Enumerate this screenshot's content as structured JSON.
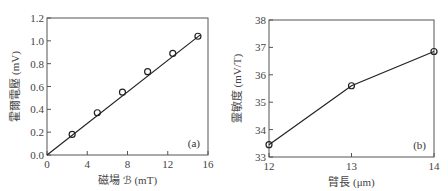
{
  "chart_data": [
    {
      "type": "line",
      "panel_label": "(a)",
      "title": "",
      "xlabel": "磁場 𝒷 (mT)",
      "ylabel": "霍爾電壓 (mV)",
      "xlim": [
        0,
        16
      ],
      "ylim": [
        0.0,
        1.2
      ],
      "xticks": [
        "0",
        "4",
        "8",
        "12",
        "16"
      ],
      "yticks": [
        "0.0",
        "0.2",
        "0.4",
        "0.6",
        "0.8",
        "1.0",
        "1.2"
      ],
      "grid": false,
      "markers": "open-circle",
      "fit_line": {
        "from": [
          0,
          0
        ],
        "to": [
          15.2,
          1.05
        ]
      },
      "x": [
        2.5,
        5,
        7.5,
        10,
        12.5,
        15
      ],
      "series": [
        {
          "name": "Hall voltage",
          "values": [
            0.18,
            0.37,
            0.55,
            0.73,
            0.89,
            1.04
          ]
        }
      ]
    },
    {
      "type": "line",
      "panel_label": "(b)",
      "title": "",
      "xlabel": "臂長 (μm)",
      "ylabel": "靈敏度 (mV/T)",
      "xlim": [
        12,
        14
      ],
      "ylim": [
        33,
        38
      ],
      "xticks": [
        "12",
        "13",
        "14"
      ],
      "yticks": [
        "33",
        "34",
        "35",
        "36",
        "37",
        "38"
      ],
      "grid": false,
      "markers": "open-circle",
      "x": [
        12,
        13,
        14
      ],
      "series": [
        {
          "name": "Sensitivity",
          "values": [
            33.45,
            35.6,
            36.85
          ]
        }
      ]
    }
  ],
  "labels": {
    "a": {
      "panel": "(a)",
      "xlabel": "磁場 ℬ (mT)",
      "ylabel": "霍爾電壓 (mV)"
    },
    "b": {
      "panel": "(b)",
      "xlabel": "臂長 (μm)",
      "ylabel": "靈敏度 (mV/T)"
    }
  },
  "colors": {
    "line": "#222222",
    "axis": "#555555",
    "text": "#444444"
  }
}
